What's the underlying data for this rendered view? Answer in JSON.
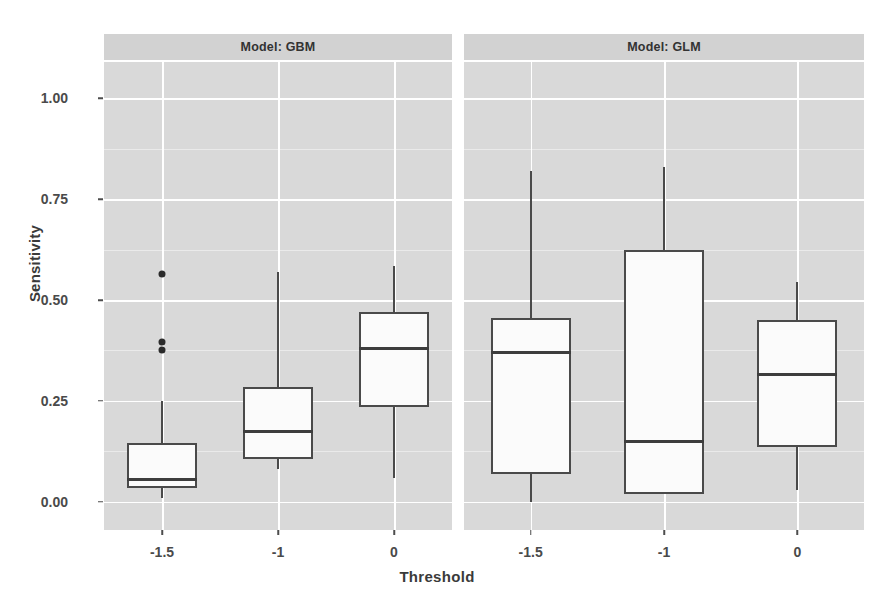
{
  "chart_data": {
    "type": "box",
    "title": "",
    "xlabel": "Threshold",
    "ylabel": "Sensitivity",
    "ylim": [
      -0.07,
      1.09
    ],
    "yticks": [
      0.0,
      0.25,
      0.5,
      0.75,
      1.0
    ],
    "ytick_labels": [
      "0.00",
      "0.25",
      "0.50",
      "0.75",
      "1.00"
    ],
    "categories": [
      "-1.5",
      "-1",
      "0"
    ],
    "grid": true,
    "legend": "none",
    "facet_variable": "Model",
    "panels": [
      {
        "strip_label": "Model: GBM",
        "boxes": [
          {
            "category": "-1.5",
            "whisker_low": 0.01,
            "q1": 0.035,
            "median": 0.055,
            "q3": 0.145,
            "whisker_high": 0.25,
            "outliers": [
              0.565,
              0.395,
              0.375
            ]
          },
          {
            "category": "-1",
            "whisker_low": 0.08,
            "q1": 0.105,
            "median": 0.175,
            "q3": 0.285,
            "whisker_high": 0.57,
            "outliers": []
          },
          {
            "category": "0",
            "whisker_low": 0.06,
            "q1": 0.235,
            "median": 0.38,
            "q3": 0.47,
            "whisker_high": 0.585,
            "outliers": []
          }
        ]
      },
      {
        "strip_label": "Model: GLM",
        "boxes": [
          {
            "category": "-1.5",
            "whisker_low": 0.0,
            "q1": 0.07,
            "median": 0.37,
            "q3": 0.455,
            "whisker_high": 0.82,
            "outliers": []
          },
          {
            "category": "-1",
            "whisker_low": 0.02,
            "q1": 0.02,
            "median": 0.15,
            "q3": 0.625,
            "whisker_high": 0.83,
            "outliers": []
          },
          {
            "category": "0",
            "whisker_low": 0.03,
            "q1": 0.135,
            "median": 0.315,
            "q3": 0.45,
            "whisker_high": 0.545,
            "outliers": []
          }
        ]
      }
    ]
  },
  "colors": {
    "panel_background": "#d9d9d9",
    "strip_background": "#d2d2d2",
    "gridline_major": "#ffffff",
    "box_outline": "#4a4a4a",
    "box_fill": "#fbfbfb",
    "text": "#3a3a3a"
  }
}
